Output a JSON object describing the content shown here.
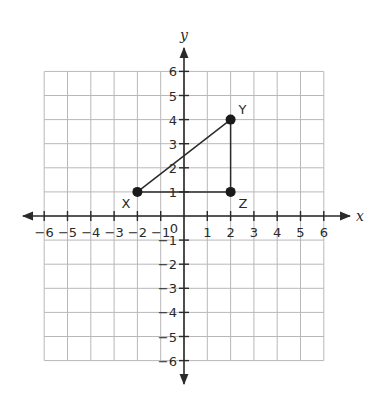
{
  "chart_data": {
    "type": "scatter",
    "title": "",
    "xlabel": "x",
    "ylabel": "y",
    "xlim": [
      -6,
      6
    ],
    "ylim": [
      -6,
      6
    ],
    "grid": true,
    "x_ticks": [
      -6,
      -5,
      -4,
      -3,
      -2,
      -1,
      1,
      2,
      3,
      4,
      5,
      6
    ],
    "y_ticks": [
      -6,
      -5,
      -4,
      -3,
      -2,
      -1,
      1,
      2,
      3,
      4,
      5,
      6
    ],
    "origin_label": "0",
    "points": [
      {
        "label": "X",
        "x": -2,
        "y": 1
      },
      {
        "label": "Y",
        "x": 2,
        "y": 4
      },
      {
        "label": "Z",
        "x": 2,
        "y": 1
      }
    ],
    "segments": [
      {
        "from": "X",
        "to": "Y"
      },
      {
        "from": "Y",
        "to": "Z"
      },
      {
        "from": "Z",
        "to": "X"
      }
    ],
    "shape": "right triangle XYZ"
  },
  "colors": {
    "grid": "#b8b8b8",
    "axis": "#2a2a2a",
    "point": "#1a1a1a"
  }
}
